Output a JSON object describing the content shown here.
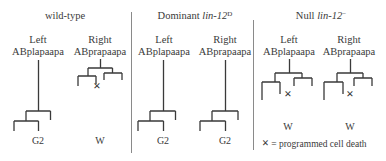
{
  "figure": {
    "panels": [
      {
        "id": "wild-type",
        "title": "wild-type",
        "title_italic": "",
        "title_sup": "",
        "cells": [
          {
            "side": "Left",
            "lineage": "ABplapaapa",
            "fate": "G2",
            "death": false
          },
          {
            "side": "Right",
            "lineage": "ABprapaapa",
            "fate": "W",
            "death": true
          }
        ]
      },
      {
        "id": "dominant",
        "title": "Dominant ",
        "title_italic": "lin-12",
        "title_sup": "D",
        "cells": [
          {
            "side": "Left",
            "lineage": "ABplapaapa",
            "fate": "G2",
            "death": false
          },
          {
            "side": "Right",
            "lineage": "ABprapaapa",
            "fate": "G2",
            "death": false
          }
        ]
      },
      {
        "id": "null",
        "title": "Null ",
        "title_italic": "lin-12",
        "title_sup": "−",
        "cells": [
          {
            "side": "Left",
            "lineage": "ABplapaapa",
            "fate": "W",
            "death": true
          },
          {
            "side": "Right",
            "lineage": "ABprapaapa",
            "fate": "W",
            "death": true
          }
        ]
      }
    ],
    "legend": {
      "symbol": "×",
      "text": "= programmed cell death"
    },
    "colors": {
      "ink": "#3a3a3a",
      "divider": "#8a8a8a",
      "background": "#ffffff"
    }
  }
}
